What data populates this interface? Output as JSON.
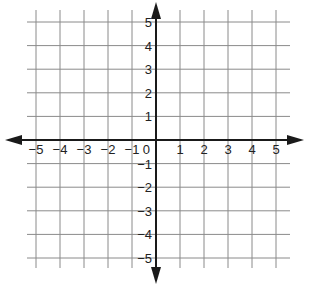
{
  "diagram": {
    "type": "coordinate-plane",
    "x_range": [
      -5,
      5
    ],
    "y_range": [
      -5,
      5
    ],
    "grid": true,
    "x_tick_labels": [
      "-5",
      "-4",
      "-3",
      "-2",
      "-1",
      "0",
      "1",
      "2",
      "3",
      "4",
      "5"
    ],
    "y_tick_labels": [
      "5",
      "4",
      "3",
      "2",
      "1",
      "-1",
      "-2",
      "-3",
      "-4",
      "-5"
    ],
    "origin_label": "0",
    "colors": {
      "grid": "#8a8a8a",
      "axis": "#1a1a1a",
      "text": "#222222",
      "background": "#ffffff"
    }
  }
}
